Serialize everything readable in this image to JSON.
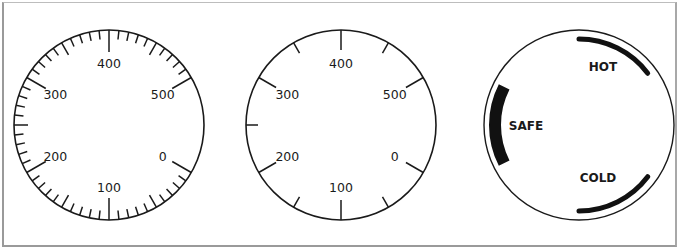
{
  "figure": {
    "dials": [
      {
        "id": "dial-fine-scale",
        "labels": [
          "0",
          "100",
          "200",
          "300",
          "400",
          "500"
        ],
        "scale": "major ticks every 100 with 9 minor ticks between labels; no graduations between 500 and 0"
      },
      {
        "id": "dial-coarse-scale",
        "labels": [
          "0",
          "100",
          "200",
          "300",
          "400",
          "500"
        ],
        "scale": "major ticks every 100 with one intermediate tick between labels; no graduation between 500 and 0"
      },
      {
        "id": "dial-zone-scale",
        "zones": [
          {
            "label": "HOT"
          },
          {
            "label": "SAFE"
          },
          {
            "label": "COLD"
          }
        ]
      }
    ]
  }
}
